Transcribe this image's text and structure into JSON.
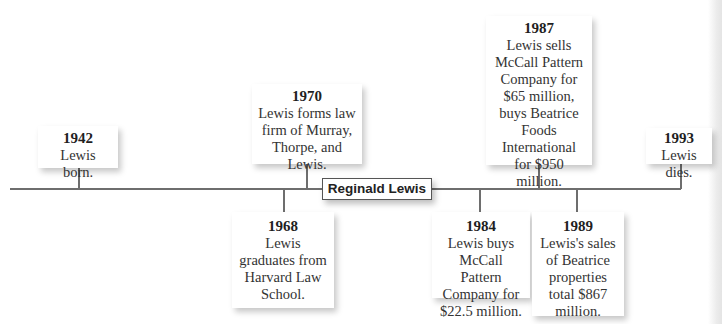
{
  "title": "Reginald Lewis",
  "colors": {
    "line": "#6e6e6e",
    "card_bg": "#ffffff",
    "text": "#333333"
  },
  "events_above": [
    {
      "year": "1942",
      "text": "Lewis born."
    },
    {
      "year": "1970",
      "text": "Lewis forms law firm of Murray, Thorpe, and Lewis."
    },
    {
      "year": "1987",
      "text": "Lewis sells McCall Pattern Company for $65 million, buys Beatrice Foods International for $950 million."
    },
    {
      "year": "1993",
      "text": "Lewis dies."
    }
  ],
  "events_below": [
    {
      "year": "1968",
      "text": "Lewis graduates from Harvard Law School."
    },
    {
      "year": "1984",
      "text": "Lewis buys McCall Pattern Company for $22.5 million."
    },
    {
      "year": "1989",
      "text": "Lewis's sales of Beatrice properties total $867 million."
    }
  ]
}
